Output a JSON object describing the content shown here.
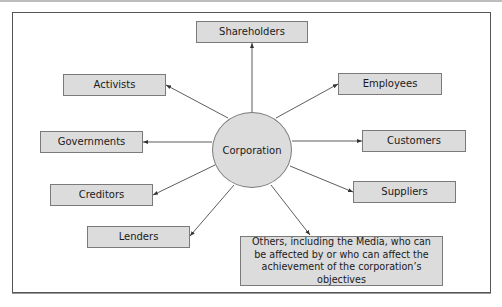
{
  "diagram": {
    "hub": {
      "label": "Corporation"
    },
    "nodes": [
      {
        "id": "shareholders",
        "label": "Shareholders"
      },
      {
        "id": "activists",
        "label": "Activists"
      },
      {
        "id": "employees",
        "label": "Employees"
      },
      {
        "id": "governments",
        "label": "Governments"
      },
      {
        "id": "customers",
        "label": "Customers"
      },
      {
        "id": "creditors",
        "label": "Creditors"
      },
      {
        "id": "suppliers",
        "label": "Suppliers"
      },
      {
        "id": "lenders",
        "label": "Lenders"
      },
      {
        "id": "others",
        "label": "Others, including the Media, who can be affected by or who can affect the achievement of the corporation’s objectives",
        "lines": [
          "Others, including the Media, who can",
          "be affected by or who can affect the",
          "achievement of the corporation’s objectives"
        ]
      }
    ],
    "edges": [
      {
        "from": "Corporation",
        "to": "Shareholders"
      },
      {
        "from": "Corporation",
        "to": "Activists"
      },
      {
        "from": "Corporation",
        "to": "Employees"
      },
      {
        "from": "Corporation",
        "to": "Governments"
      },
      {
        "from": "Corporation",
        "to": "Customers"
      },
      {
        "from": "Corporation",
        "to": "Creditors"
      },
      {
        "from": "Corporation",
        "to": "Suppliers"
      },
      {
        "from": "Corporation",
        "to": "Lenders"
      },
      {
        "from": "Corporation",
        "to": "Others"
      }
    ],
    "colors": {
      "box_fill": "#dcdcdc",
      "box_border": "#7a7a7a",
      "line": "#333333",
      "frame": "#555555"
    }
  }
}
